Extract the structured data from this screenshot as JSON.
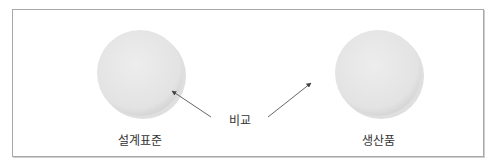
{
  "diagram": {
    "left": {
      "label": "설계표준",
      "cx": 140,
      "cy": 73,
      "r": 43
    },
    "right": {
      "label": "생산품",
      "cx": 378,
      "cy": 73,
      "r": 43
    },
    "center": {
      "label": "비교"
    },
    "colors": {
      "circle_fill": "#e6e6e6",
      "circle_shadow": "#b5b5b5",
      "arrow": "#555555",
      "border": "#a8a8a8",
      "text": "#333333"
    }
  }
}
